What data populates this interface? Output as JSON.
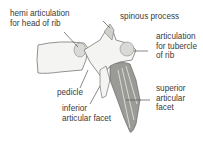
{
  "diagram": {
    "labels": {
      "hemi_articulation": "hemi articulation\nfor head of rib",
      "spinous_process": "spinous process",
      "articulation_tubercle": "articulation\nfor tubercle\nof rib",
      "pedicle": "pedicle",
      "inferior_facet": "inferior\narticular facet",
      "superior_facet": "superior\narticular\nfacet"
    },
    "colors": {
      "text": "#3a3a3a",
      "line": "#555555",
      "bone_fill": "#f4f4f2",
      "bone_stroke": "#777777",
      "facet_fill": "#d9d9d6"
    }
  }
}
